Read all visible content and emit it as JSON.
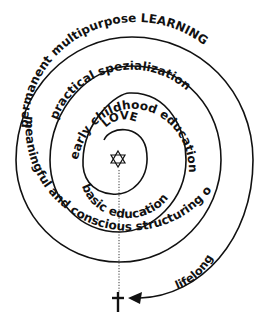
{
  "diagram": {
    "type": "spiral",
    "center_symbol": "star-of-david",
    "end_symbol": "cross",
    "labels": {
      "love": "LOVE",
      "early_childhood": "early childhood education",
      "basic": "basic education",
      "practical": "practical spezialization",
      "meaningful": "meaningful and conscious structuring of life",
      "permanent": "permanent multipurpose LEARNING",
      "lifelong": "lifelong"
    },
    "colors": {
      "line": "#111111",
      "background": "#ffffff"
    }
  }
}
